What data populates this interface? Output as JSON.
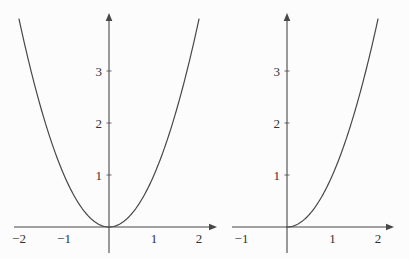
{
  "figure": {
    "background": "#fcfcfc",
    "ink_color": "#474747",
    "label_color": "#333333"
  },
  "chart_data": [
    {
      "id": "left-parabola-plot",
      "type": "line",
      "title": "",
      "function": "y = x^2",
      "curve": {
        "kind": "power",
        "exponent": 2,
        "x_min": -2.0,
        "x_max": 2.0
      },
      "points": [
        {
          "x": -2,
          "y": 4
        },
        {
          "x": -1.5,
          "y": 2.25
        },
        {
          "x": -1,
          "y": 1
        },
        {
          "x": -0.5,
          "y": 0.25
        },
        {
          "x": 0,
          "y": 0
        },
        {
          "x": 0.5,
          "y": 0.25
        },
        {
          "x": 1,
          "y": 1
        },
        {
          "x": 1.5,
          "y": 2.25
        },
        {
          "x": 2,
          "y": 4
        }
      ],
      "x_ticks": [
        {
          "v": -2,
          "label": "−2"
        },
        {
          "v": -1,
          "label": "−1"
        },
        {
          "v": 1,
          "label": "1"
        },
        {
          "v": 2,
          "label": "2"
        }
      ],
      "y_ticks": [
        {
          "v": 1,
          "label": "1"
        },
        {
          "v": 2,
          "label": "2"
        },
        {
          "v": 3,
          "label": "3"
        }
      ],
      "x_range": [
        -2.1,
        2.4
      ],
      "y_range": [
        -0.5,
        4.1
      ],
      "grid": false,
      "legend": null
    },
    {
      "id": "right-parabola-plot",
      "type": "line",
      "title": "",
      "function": "y = x^2, x ≥ 0",
      "curve": {
        "kind": "power",
        "exponent": 2,
        "x_min": 0.0,
        "x_max": 2.0
      },
      "points": [
        {
          "x": 0,
          "y": 0
        },
        {
          "x": 0.5,
          "y": 0.25
        },
        {
          "x": 1,
          "y": 1
        },
        {
          "x": 1.5,
          "y": 2.25
        },
        {
          "x": 2,
          "y": 4
        }
      ],
      "x_ticks": [
        {
          "v": -1,
          "label": "−1"
        },
        {
          "v": 1,
          "label": "1"
        },
        {
          "v": 2,
          "label": "2"
        }
      ],
      "y_ticks": [
        {
          "v": 1,
          "label": "1"
        },
        {
          "v": 2,
          "label": "2"
        },
        {
          "v": 3,
          "label": "3"
        }
      ],
      "x_range": [
        -1.25,
        2.35
      ],
      "y_range": [
        -0.5,
        4.1
      ],
      "grid": false,
      "legend": null
    }
  ]
}
